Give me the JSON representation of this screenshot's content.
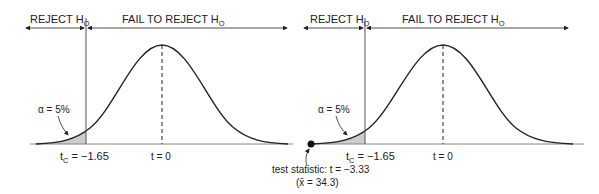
{
  "panels": [
    {
      "reject_label": "REJECT H",
      "reject_sub": "O",
      "fail_label": "FAIL TO REJECT H",
      "fail_sub": "O",
      "alpha_label": "α = 5%",
      "tc_prefix": "t",
      "tc_sub": "C",
      "tc_value": " = −1.65",
      "center_label": "t = 0"
    },
    {
      "reject_label": "REJECT H",
      "reject_sub": "O",
      "fail_label": "FAIL TO REJECT H",
      "fail_sub": "O",
      "alpha_label": "α = 5%",
      "tc_prefix": "t",
      "tc_sub": "C",
      "tc_value": " = −1.65",
      "center_label": "t = 0",
      "test_stat_line1": "test statistic: t = −3.33",
      "test_stat_line2": "(x̄ = 34.3)"
    }
  ],
  "colors": {
    "ink": "#222222",
    "shade": "#cccccc",
    "guide": "#888888"
  }
}
